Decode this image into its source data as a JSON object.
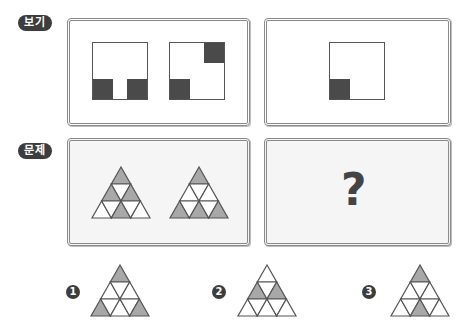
{
  "labels": {
    "example_badge": "보기",
    "problem_badge": "문제"
  },
  "example": {
    "panel_left": {
      "squares": [
        {
          "filled_cells": [
            "bottom-left",
            "bottom-right"
          ]
        },
        {
          "filled_cells": [
            "top-right",
            "bottom-left"
          ]
        }
      ]
    },
    "panel_right": {
      "squares": [
        {
          "filled_cells": [
            "bottom-left"
          ]
        }
      ]
    }
  },
  "problem": {
    "panel_left": {
      "triangles": [
        {
          "filled": [
            "r1u1",
            "r2u1",
            "r2u2",
            "r3u2"
          ]
        },
        {
          "filled": [
            "r1u1",
            "r3u1",
            "r3u2",
            "r3u3"
          ]
        }
      ]
    },
    "panel_right": {
      "question_mark": "?"
    }
  },
  "options": [
    {
      "number": "1",
      "filled": [
        "r1u1",
        "r3u1",
        "r3u3"
      ]
    },
    {
      "number": "2",
      "filled": [
        "r2u1",
        "r2u2"
      ]
    },
    {
      "number": "3",
      "filled": [
        "r1u1",
        "r3u2"
      ]
    }
  ],
  "colors": {
    "fill_gray": "#a8a8a8",
    "dark_block": "#4a4a4a",
    "badge_bg": "#3d3d3d"
  }
}
